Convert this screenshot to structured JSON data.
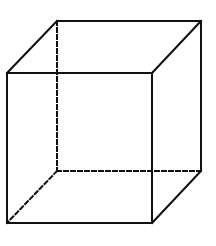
{
  "diagram": {
    "title": "Cube",
    "stroke_color": "#111111",
    "background_color": "#ffffff",
    "stroke_width": 2,
    "vertices": {
      "front_top_left": [
        7,
        73
      ],
      "front_top_right": [
        152,
        73
      ],
      "front_bottom_left": [
        7,
        223
      ],
      "front_bottom_right": [
        152,
        223
      ],
      "back_top_left": [
        57,
        21
      ],
      "back_top_right": [
        201,
        21
      ],
      "back_bottom_left": [
        57,
        171
      ],
      "back_bottom_right": [
        201,
        171
      ]
    },
    "visible_edges": [
      {
        "name": "front-top-edge",
        "from": "front_top_left",
        "to": "front_top_right"
      },
      {
        "name": "front-bottom-edge",
        "from": "front_bottom_left",
        "to": "front_bottom_right"
      },
      {
        "name": "front-left-edge",
        "from": "front_top_left",
        "to": "front_bottom_left"
      },
      {
        "name": "front-right-edge",
        "from": "front_top_right",
        "to": "front_bottom_right"
      },
      {
        "name": "back-top-edge",
        "from": "back_top_left",
        "to": "back_top_right"
      },
      {
        "name": "back-right-edge",
        "from": "back_top_right",
        "to": "back_bottom_right"
      },
      {
        "name": "top-left-depth-edge",
        "from": "front_top_left",
        "to": "back_top_left"
      },
      {
        "name": "top-right-depth-edge",
        "from": "front_top_right",
        "to": "back_top_right"
      },
      {
        "name": "bottom-right-depth-edge",
        "from": "front_bottom_right",
        "to": "back_bottom_right"
      }
    ],
    "hidden_edges": [
      {
        "name": "back-left-edge-hidden",
        "from": "back_top_left",
        "to": "back_bottom_left"
      },
      {
        "name": "back-bottom-edge-hidden",
        "from": "back_bottom_left",
        "to": "back_bottom_right"
      },
      {
        "name": "bottom-left-depth-edge-hidden",
        "from": "back_bottom_left",
        "to": "front_bottom_left"
      }
    ],
    "dash_pattern": "4 3"
  }
}
